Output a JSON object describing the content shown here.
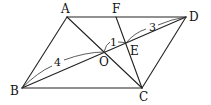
{
  "diagram": {
    "type": "geometry",
    "points": {
      "A": {
        "label": "A",
        "x": 67,
        "y": 17,
        "lx": 66,
        "ly": 13
      },
      "F": {
        "label": "F",
        "x": 116,
        "y": 17,
        "lx": 116,
        "ly": 13
      },
      "D": {
        "label": "D",
        "x": 186,
        "y": 17,
        "lx": 193,
        "ly": 21
      },
      "B": {
        "label": "B",
        "x": 22,
        "y": 88,
        "lx": 15,
        "ly": 95
      },
      "C": {
        "label": "C",
        "x": 142,
        "y": 88,
        "lx": 144,
        "ly": 101
      },
      "O": {
        "label": "O",
        "x": 104,
        "y": 52,
        "lx": 104,
        "ly": 66
      },
      "E": {
        "label": "E",
        "x": 126,
        "y": 43,
        "lx": 134,
        "ly": 55
      }
    },
    "segments": [
      [
        "A",
        "D"
      ],
      [
        "B",
        "C"
      ],
      [
        "A",
        "B"
      ],
      [
        "D",
        "C"
      ],
      [
        "A",
        "C"
      ],
      [
        "B",
        "D"
      ],
      [
        "F",
        "C"
      ]
    ],
    "measurements": [
      {
        "from": "B",
        "to": "O",
        "value": "4"
      },
      {
        "from": "O",
        "to": "E",
        "value": "1"
      },
      {
        "from": "E",
        "to": "D",
        "value": "3"
      }
    ]
  }
}
